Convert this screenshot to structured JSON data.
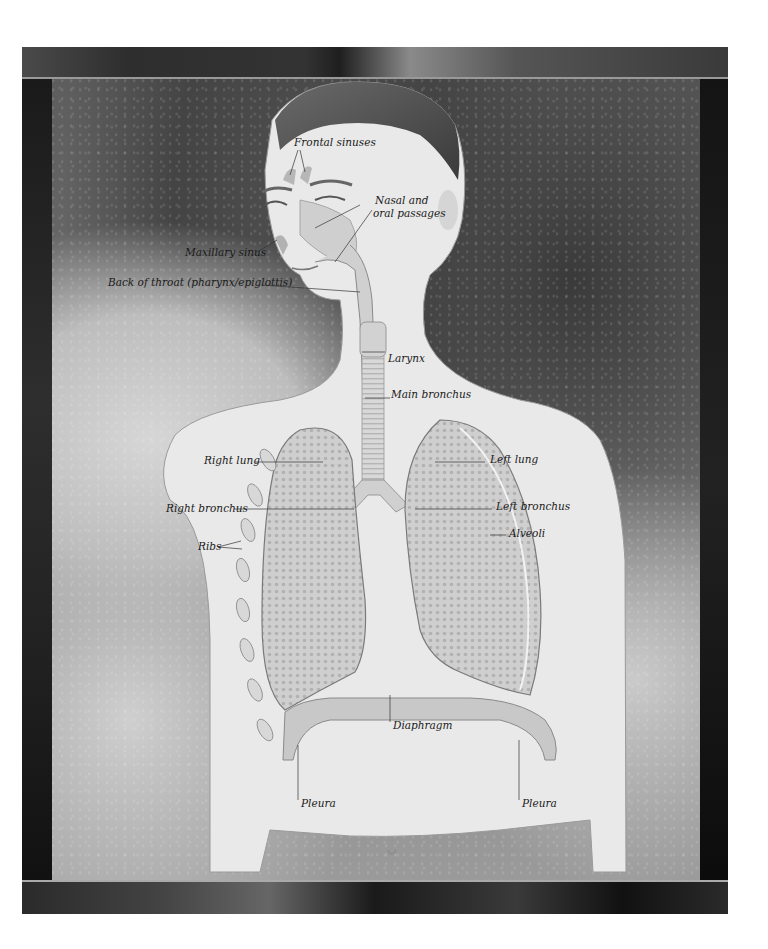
{
  "diagram": {
    "labels": {
      "frontal_sinuses": "Frontal sinuses",
      "nasal_oral_line1": "Nasal and",
      "nasal_oral_line2": "oral passages",
      "maxillary_sinus": "Maxillary sinus",
      "back_of_throat": "Back of throat (pharynx/epiglottis)",
      "larynx": "Larynx",
      "main_bronchus": "Main bronchus",
      "right_lung": "Right lung",
      "left_lung": "Left lung",
      "right_bronchus": "Right bronchus",
      "left_bronchus": "Left bronchus",
      "alveoli": "Alveoli",
      "ribs": "Ribs",
      "diaphragm": "Diaphragm",
      "pleura_left": "Pleura",
      "pleura_right": "Pleura"
    },
    "colors": {
      "label_text": "#1a1a1a",
      "leader_line": "#333333",
      "skin": "#eaeaea",
      "lung_fill": "#c9c9c9",
      "frame_dark": "#2a2a2a"
    }
  }
}
